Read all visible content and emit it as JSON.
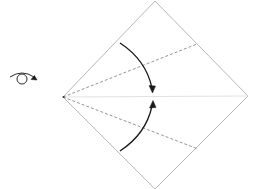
{
  "diagram": {
    "type": "origami-instruction",
    "colors": {
      "paper_edge": "#b8b8b8",
      "center_crease": "#e2e2e2",
      "valley_fold": "#8a8a8a",
      "arrow": "#1a1a1a",
      "symbol": "#2a2a2a"
    },
    "symbols": [
      {
        "name": "turn-over",
        "meaning": "turn the model over"
      }
    ],
    "paper": {
      "shape": "square (diamond orientation)",
      "vertices": {
        "top": [
          155,
          1
        ],
        "right": [
          248,
          96
        ],
        "bottom": [
          155,
          189
        ],
        "left": [
          63,
          97
        ]
      }
    },
    "creases": [
      {
        "kind": "existing-crease",
        "from": [
          63,
          97
        ],
        "to": [
          248,
          96
        ]
      }
    ],
    "folds": [
      {
        "kind": "valley",
        "from": [
          63,
          97
        ],
        "to": [
          197,
          44
        ]
      },
      {
        "kind": "valley",
        "from": [
          63,
          97
        ],
        "to": [
          198,
          149
        ]
      }
    ],
    "arrows": [
      {
        "direction": "down",
        "from": [
          120,
          42
        ],
        "to": [
          152,
          92
        ]
      },
      {
        "direction": "up",
        "from": [
          120,
          151
        ],
        "to": [
          153,
          101
        ]
      }
    ]
  }
}
